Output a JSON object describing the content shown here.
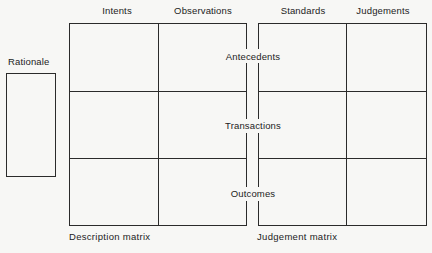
{
  "diagram": {
    "background_color": "#f7f7f5",
    "line_color": "#2b2b2b",
    "text_color": "#1c1c1c"
  },
  "rationale_box": {
    "label": "Rationale"
  },
  "column_headers": [
    {
      "label": "Intents"
    },
    {
      "label": "Observations"
    },
    {
      "label": "Standards"
    },
    {
      "label": "Judgements"
    }
  ],
  "row_labels": [
    {
      "label": "Antecedents"
    },
    {
      "label": "Transactions"
    },
    {
      "label": "Outcomes"
    }
  ],
  "matrix_captions": [
    {
      "label": "Description matrix"
    },
    {
      "label": "Judgement matrix"
    }
  ]
}
